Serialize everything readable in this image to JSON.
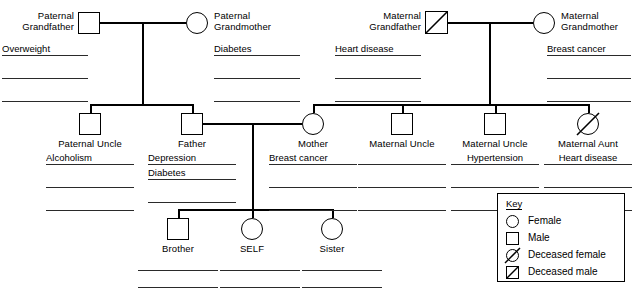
{
  "chart": {
    "type": "pedigree"
  },
  "generations": {
    "grandparents": [
      {
        "id": "paternal-grandfather",
        "name_line1": "Paternal",
        "name_line2": "Grandfather",
        "symbol": "male",
        "deceased": false,
        "conditions": [
          "Overweight",
          "",
          ""
        ]
      },
      {
        "id": "paternal-grandmother",
        "name_line1": "Paternal",
        "name_line2": "Grandmother",
        "symbol": "female",
        "deceased": false,
        "conditions": [
          "Diabetes",
          "",
          ""
        ]
      },
      {
        "id": "maternal-grandfather",
        "name_line1": "Maternal",
        "name_line2": "Grandfather",
        "symbol": "male",
        "deceased": true,
        "conditions": [
          "Heart disease",
          "",
          ""
        ]
      },
      {
        "id": "maternal-grandmother",
        "name_line1": "Maternal",
        "name_line2": "Grandmother",
        "symbol": "female",
        "deceased": false,
        "conditions": [
          "Breast cancer",
          "",
          ""
        ]
      }
    ],
    "parents": [
      {
        "id": "paternal-uncle",
        "name": "Paternal Uncle",
        "symbol": "male",
        "deceased": false,
        "conditions": [
          "Alcoholism",
          "",
          ""
        ]
      },
      {
        "id": "father",
        "name": "Father",
        "symbol": "male",
        "deceased": false,
        "conditions": [
          "Depression",
          "Diabetes",
          ""
        ]
      },
      {
        "id": "mother",
        "name": "Mother",
        "symbol": "female",
        "deceased": false,
        "conditions": [
          "Breast cancer",
          "",
          ""
        ]
      },
      {
        "id": "maternal-uncle-1",
        "name": "Maternal Uncle",
        "symbol": "male",
        "deceased": false,
        "conditions": [
          "",
          "",
          ""
        ]
      },
      {
        "id": "maternal-uncle-2",
        "name": "Maternal Uncle",
        "symbol": "male",
        "deceased": false,
        "conditions": [
          "Hypertension",
          "",
          ""
        ]
      },
      {
        "id": "maternal-aunt",
        "name": "Maternal Aunt",
        "symbol": "female",
        "deceased": true,
        "conditions": [
          "Heart disease",
          "",
          ""
        ]
      }
    ],
    "children": [
      {
        "id": "brother",
        "name": "Brother",
        "symbol": "male",
        "deceased": false,
        "conditions": [
          "",
          "",
          ""
        ]
      },
      {
        "id": "self",
        "name": "SELF",
        "symbol": "female",
        "deceased": false,
        "conditions": [
          "",
          "",
          ""
        ]
      },
      {
        "id": "sister",
        "name": "Sister",
        "symbol": "female",
        "deceased": false,
        "conditions": [
          "",
          "",
          ""
        ]
      }
    ]
  },
  "key": {
    "title": "Key",
    "entries": [
      {
        "symbol": "female",
        "label": "Female"
      },
      {
        "symbol": "male",
        "label": "Male"
      },
      {
        "symbol": "deceased-female",
        "label": "Deceased female"
      },
      {
        "symbol": "deceased-male",
        "label": "Deceased male"
      }
    ]
  }
}
